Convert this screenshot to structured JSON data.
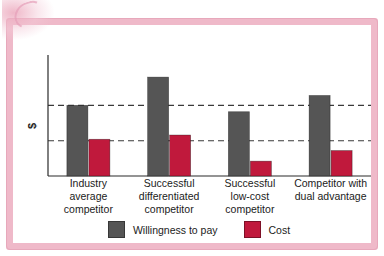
{
  "figure": {
    "frame_color": "#efb9c9",
    "background": "#ffffff",
    "title_remnant": "willingness to pay"
  },
  "legend": {
    "position": "bottom-center",
    "items": [
      {
        "label": "Willingness to pay",
        "color": "#555555"
      },
      {
        "label": "Cost",
        "color": "#c0193c"
      }
    ]
  },
  "axis": {
    "ylabel": "$",
    "ylabel_rotated": true,
    "tick_labels": [],
    "gridlines": "two horizontal dashed reference lines"
  },
  "chart_data": {
    "type": "bar",
    "title": "",
    "subtitle": "",
    "xlabel": "",
    "ylabel": "$",
    "ylim": [
      0,
      160
    ],
    "grid": true,
    "grid_style": "dashed",
    "gridline_values": [
      50,
      100
    ],
    "legend_position": "bottom-center",
    "axis_tick_labels_shown": false,
    "categories": [
      "Industry average competitor",
      "Successful differentiated competitor",
      "Successful low-cost competitor",
      "Competitor with dual advantage"
    ],
    "category_lines": [
      [
        "Industry",
        "average",
        "competitor"
      ],
      [
        "Successful",
        "differentiated",
        "competitor"
      ],
      [
        "Successful",
        "low-cost",
        "competitor"
      ],
      [
        "Competitor with",
        "dual advantage"
      ]
    ],
    "series": [
      {
        "name": "Willingness to pay",
        "color": "#555555",
        "values": [
          100,
          140,
          91,
          114
        ]
      },
      {
        "name": "Cost",
        "color": "#c0193c",
        "values": [
          52,
          58,
          21,
          36
        ]
      }
    ],
    "annotations": [
      "Dashed reference line at the industry-average willingness to pay (100)",
      "Dashed reference line at the industry-average cost (50)"
    ]
  }
}
